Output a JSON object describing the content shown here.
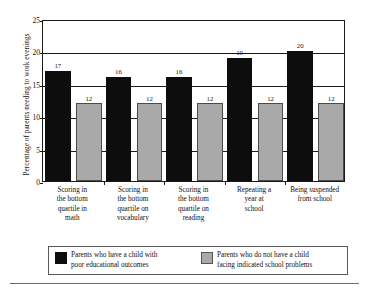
{
  "chart_data": {
    "type": "bar",
    "title": "",
    "subtitle": "",
    "xlabel": "",
    "ylabel": "Percentage of parents needing to work evenings",
    "ylim": [
      0,
      25
    ],
    "yticks": [
      0,
      5,
      10,
      15,
      20,
      25
    ],
    "ytick_labels": [
      "0",
      "5",
      "10",
      "15",
      "20",
      "25"
    ],
    "grid": true,
    "legend_position": "bottom",
    "categories": [
      "Scoring in\nthe bottom\nquartile in\nmath",
      "Scoring in\nthe bottom\nquartile on\nvocabulary",
      "Scoring in\nthe bottom\nquartile on\nreading",
      "Repeating a\nyear at\nschool",
      "Being suspended\nfrom school"
    ],
    "series": [
      {
        "name": "Parents who have a child with\npoor educational outcomes",
        "color": "#0d0d0d",
        "values": [
          17,
          16,
          16,
          19,
          20
        ]
      },
      {
        "name": "Parents who do not have a child\nfacing indicated school problems",
        "color": "#a9a9a9",
        "values": [
          12,
          12,
          12,
          12,
          12
        ]
      }
    ]
  },
  "legend": {
    "entries": [
      {
        "label": "Parents who have a child with\npoor educational outcomes",
        "swatch": "dark-swatch"
      },
      {
        "label": "Parents who do not have a child\nfacing indicated school problems",
        "swatch": "light-swatch"
      }
    ]
  }
}
